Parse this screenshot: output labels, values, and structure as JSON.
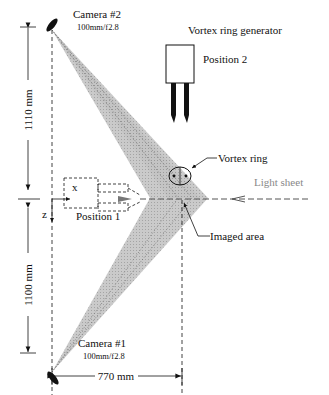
{
  "diagram": {
    "type": "experimental-setup-schematic",
    "cameras": [
      {
        "name": "Camera #2",
        "lens": "100mm/f2.8"
      },
      {
        "name": "Camera #1",
        "lens": "100mm/f2.8"
      }
    ],
    "generator": {
      "label": "Vortex ring generator",
      "position_label": "Position 2"
    },
    "position1_label": "Position 1",
    "vortex_label": "Vortex ring",
    "light_label": "Light sheet",
    "imaged_label": "Imaged area",
    "axes": {
      "x": "x",
      "z": "z"
    },
    "dimensions": {
      "upper_vertical": "1110 mm",
      "lower_vertical": "1100 mm",
      "horizontal": "770 mm"
    },
    "colors": {
      "cone_fill": "#c4c4c4",
      "line": "#111111",
      "light_sheet_text": "#888888"
    }
  }
}
